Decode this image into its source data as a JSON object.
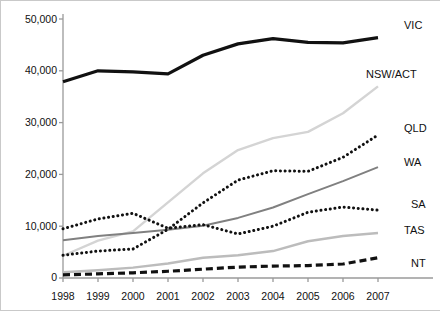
{
  "chart_data": {
    "type": "line",
    "title": "",
    "subtitle": "",
    "xlabel": "",
    "ylabel": "",
    "x": [
      1998,
      1999,
      2000,
      2001,
      2002,
      2003,
      2004,
      2005,
      2006,
      2007
    ],
    "xtick_labels": [
      "1998",
      "1999",
      "2000",
      "2001",
      "2002",
      "2003",
      "2004",
      "2005",
      "2006",
      "2007"
    ],
    "ytick_labels": [
      "0",
      "10,000",
      "20,000",
      "30,000",
      "40,000",
      "50,000"
    ],
    "ytick_values": [
      0,
      10000,
      20000,
      30000,
      40000,
      50000
    ],
    "ylim": [
      0,
      50000
    ],
    "xlim": [
      1998,
      2007
    ],
    "grid": false,
    "legend_position": "right-inline-labels",
    "series": [
      {
        "name": "VIC",
        "label": "VIC",
        "color": "#111111",
        "style": "solid-thick",
        "values": [
          37900,
          40000,
          39800,
          39400,
          43000,
          45200,
          46200,
          45500,
          45400,
          46400
        ]
      },
      {
        "name": "NSW/ACT",
        "label": "NSW/ACT",
        "color": "#d4d4d4",
        "style": "solid-light",
        "values": [
          4300,
          7200,
          9000,
          14600,
          20200,
          24700,
          27000,
          28200,
          31800,
          37000
        ]
      },
      {
        "name": "QLD",
        "label": "QLD",
        "color": "#111111",
        "style": "dotted",
        "values": [
          4400,
          5200,
          5600,
          9400,
          14500,
          18900,
          20700,
          20600,
          23300,
          27600
        ]
      },
      {
        "name": "WA",
        "label": "WA",
        "color": "#808080",
        "style": "solid-medium",
        "values": [
          7300,
          8100,
          8700,
          9300,
          10100,
          11600,
          13600,
          16200,
          18700,
          21400
        ]
      },
      {
        "name": "SA",
        "label": "SA",
        "color": "#111111",
        "style": "dotted",
        "values": [
          9500,
          11400,
          12500,
          9600,
          10300,
          8500,
          10000,
          12700,
          13700,
          13100
        ]
      },
      {
        "name": "TAS",
        "label": "TAS",
        "color": "#bcbcbc",
        "style": "solid-light",
        "values": [
          1100,
          1500,
          2000,
          2800,
          3900,
          4400,
          5200,
          7100,
          8100,
          8700
        ]
      },
      {
        "name": "NT",
        "label": "NT",
        "color": "#111111",
        "style": "dashed",
        "values": [
          600,
          800,
          1000,
          1300,
          1700,
          2100,
          2300,
          2400,
          2700,
          3900
        ]
      }
    ]
  },
  "axis": {
    "y_labels": [
      "50,000",
      "40,000",
      "30,000",
      "20,000",
      "10,000",
      "0"
    ],
    "x_labels": [
      "1998",
      "1999",
      "2000",
      "2001",
      "2002",
      "2003",
      "2004",
      "2005",
      "2006",
      "2007"
    ]
  },
  "series_labels": {
    "vic": "VIC",
    "nswact": "NSW/ACT",
    "qld": "QLD",
    "wa": "WA",
    "sa": "SA",
    "tas": "TAS",
    "nt": "NT"
  }
}
